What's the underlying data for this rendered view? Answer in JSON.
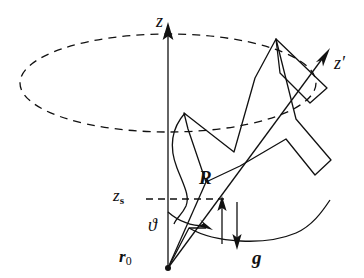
{
  "figure": {
    "kind": "physics-vector-diagram",
    "background_color": "#ffffff",
    "stroke_color": "#111111",
    "width": 364,
    "height": 278
  },
  "labels": {
    "z_axis": "z",
    "z_prime_axis": "z",
    "z_prime_mark": "′",
    "z_s": "z",
    "z_s_subscript": "s",
    "theta": "ϑ",
    "r0": "r",
    "r0_subscript": "0",
    "R": "R",
    "g": "g"
  },
  "icons": {
    "z_axis_arrowhead": "arrowhead-up-icon",
    "z_prime_arrowhead": "arrowhead-up-right-icon",
    "g_arrowhead": "arrowhead-down-icon",
    "R_arrowhead": "arrowhead-up-icon",
    "theta_arrowhead": "arc-arrowhead-icon"
  },
  "geometry": {
    "origin": {
      "x": 168,
      "y": 268
    },
    "z_axis": {
      "x": 168,
      "y_top": 26,
      "y_bottom": 268
    },
    "z_prime_tip": {
      "x": 328,
      "y": 52
    },
    "precession_ellipse": {
      "cx": 168,
      "cy": 83,
      "rx": 148,
      "ry": 49,
      "style": "dashed"
    },
    "z_s_level": {
      "y": 199,
      "x_from": 146,
      "x_to": 222
    },
    "R_vector": {
      "from_x": 222,
      "from_y": 244,
      "to_x": 222,
      "to_y": 200
    },
    "g_vector": {
      "from_x": 237,
      "from_y": 205,
      "to_x": 237,
      "to_y": 246
    },
    "theta_arc": {
      "center_x": 168,
      "center_y": 268,
      "radius": 56
    }
  },
  "styles": {
    "line_width": 1.3,
    "dash_pattern": "7 5",
    "body_fill": "none"
  }
}
